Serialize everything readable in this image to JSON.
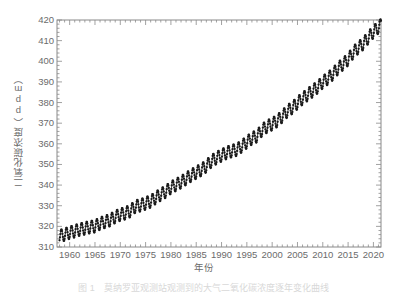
{
  "chart_data": {
    "type": "line",
    "title": "",
    "xlabel": "年份",
    "ylabel": "二氧化碳浓度（ppm）",
    "ylabel_plain": "二氧化碳浓度(ppm)",
    "xlim": [
      1957.5,
      2021.5
    ],
    "ylim": [
      310,
      420
    ],
    "ytick_labels": [
      "420",
      "410",
      "400",
      "390",
      "380",
      "370",
      "360",
      "350",
      "340",
      "330",
      "320",
      "310"
    ],
    "ytick_values": [
      420,
      410,
      400,
      390,
      380,
      370,
      360,
      350,
      340,
      330,
      320,
      310
    ],
    "xtick_labels": [
      "1960",
      "1965",
      "1970",
      "1975",
      "1980",
      "1985",
      "1990",
      "1995",
      "2000",
      "2005",
      "2010",
      "2015",
      "2020"
    ],
    "xtick_values": [
      1960,
      1965,
      1970,
      1975,
      1980,
      1985,
      1990,
      1995,
      2000,
      2005,
      2010,
      2015,
      2020
    ],
    "y_major_step": 10,
    "y_minor_step": 2,
    "x_major_step": 5,
    "x_minor_step": 1,
    "grid": false,
    "legend": null,
    "marker": "circle",
    "marker_color": "#1a1a1a",
    "line_color": "#1a1a1a",
    "axis_color": "#8a8a8a",
    "background": "#ffffff",
    "series_name": "大气二氧化碳浓度",
    "seasonal_amplitude_ppm": 6.0,
    "samples_per_year": 12,
    "annual_mean": {
      "x": [
        1958,
        1959,
        1960,
        1961,
        1962,
        1963,
        1964,
        1965,
        1966,
        1967,
        1968,
        1969,
        1970,
        1971,
        1972,
        1973,
        1974,
        1975,
        1976,
        1977,
        1978,
        1979,
        1980,
        1981,
        1982,
        1983,
        1984,
        1985,
        1986,
        1987,
        1988,
        1989,
        1990,
        1991,
        1992,
        1993,
        1994,
        1995,
        1996,
        1997,
        1998,
        1999,
        2000,
        2001,
        2002,
        2003,
        2004,
        2005,
        2006,
        2007,
        2008,
        2009,
        2010,
        2011,
        2012,
        2013,
        2014,
        2015,
        2016,
        2017,
        2018,
        2019,
        2020,
        2021
      ],
      "y": [
        315.3,
        315.98,
        316.91,
        317.64,
        318.45,
        318.99,
        319.62,
        320.04,
        321.38,
        322.16,
        323.04,
        324.62,
        325.68,
        326.32,
        327.45,
        329.68,
        330.18,
        331.11,
        332.04,
        333.83,
        335.4,
        336.84,
        338.75,
        340.11,
        341.45,
        343.05,
        344.65,
        346.12,
        347.42,
        349.19,
        351.57,
        353.12,
        354.39,
        355.61,
        356.45,
        357.1,
        358.83,
        360.82,
        362.61,
        363.73,
        366.7,
        368.38,
        369.55,
        371.14,
        373.28,
        375.8,
        377.52,
        379.8,
        381.9,
        383.79,
        385.6,
        387.43,
        389.9,
        391.65,
        393.85,
        396.52,
        398.65,
        400.83,
        404.24,
        406.55,
        408.52,
        411.44,
        414.24,
        416.45
      ]
    },
    "data_note": "海洋和大气研究：莫纳罗亚观测站月均大气二氧化碳浓度（基林曲线），含明显的年度季节振荡"
  },
  "caption": {
    "text": "图 1　莫纳罗亚观测站观测到的大气二氧化碳浓度逐年变化曲线"
  }
}
